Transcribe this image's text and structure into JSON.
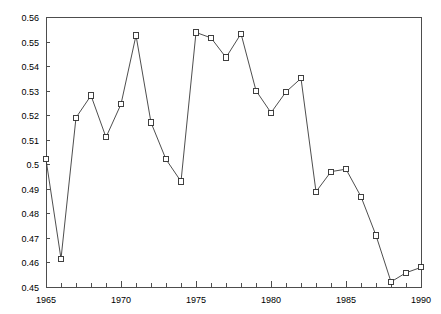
{
  "chart_data": {
    "type": "line",
    "title": "",
    "subtitle": "",
    "xlabel": "",
    "ylabel": "",
    "x": [
      1965,
      1966,
      1967,
      1968,
      1969,
      1970,
      1971,
      1972,
      1973,
      1974,
      1975,
      1976,
      1977,
      1978,
      1979,
      1980,
      1981,
      1982,
      1983,
      1984,
      1985,
      1986,
      1987,
      1988,
      1989,
      1990
    ],
    "values": [
      0.502,
      0.4615,
      0.519,
      0.528,
      0.511,
      0.5245,
      0.5525,
      0.517,
      0.502,
      0.493,
      0.5537,
      0.5515,
      0.5435,
      0.5532,
      0.53,
      0.521,
      0.5295,
      0.535,
      0.4888,
      0.497,
      0.498,
      0.4868,
      0.471,
      0.4521,
      0.4558,
      0.458
    ],
    "series": [
      {
        "name": "series-1",
        "values": [
          0.502,
          0.4615,
          0.519,
          0.528,
          0.511,
          0.5245,
          0.5525,
          0.517,
          0.502,
          0.493,
          0.5537,
          0.5515,
          0.5435,
          0.5532,
          0.53,
          0.521,
          0.5295,
          0.535,
          0.4888,
          0.497,
          0.498,
          0.4868,
          0.471,
          0.4521,
          0.4558,
          0.458
        ]
      }
    ],
    "xlim": [
      1965,
      1990
    ],
    "ylim": [
      0.45,
      0.56
    ],
    "xtick_values": [
      1965,
      1966,
      1967,
      1968,
      1969,
      1970,
      1971,
      1972,
      1973,
      1974,
      1975,
      1976,
      1977,
      1978,
      1979,
      1980,
      1981,
      1982,
      1983,
      1984,
      1985,
      1986,
      1987,
      1988,
      1989,
      1990
    ],
    "xtick_labels_shown": [
      "1965",
      "1970",
      "1975",
      "1980",
      "1985",
      "1990"
    ],
    "xtick_labels_shown_values": [
      1965,
      1970,
      1975,
      1980,
      1985,
      1990
    ],
    "ytick_values": [
      0.45,
      0.46,
      0.47,
      0.48,
      0.49,
      0.5,
      0.51,
      0.52,
      0.53,
      0.54,
      0.55,
      0.56
    ],
    "ytick_labels": [
      "0.45",
      "0.46",
      "0.47",
      "0.48",
      "0.49",
      "0.5",
      "0.51",
      "0.52",
      "0.53",
      "0.54",
      "0.55",
      "0.56"
    ],
    "grid": false,
    "legend": false,
    "legend_position": "none",
    "marker": "square-open",
    "line_color": "#3a3a3a",
    "marker_edge_color": "#2b2b2b",
    "marker_face_color": "#ffffff",
    "axis_color": "#4d4d4d",
    "background_color": "#ffffff",
    "annotations": []
  },
  "layout": {
    "plot_left": 46,
    "plot_right": 421,
    "plot_top": 17,
    "plot_bottom": 287,
    "width": 441,
    "height": 314
  }
}
